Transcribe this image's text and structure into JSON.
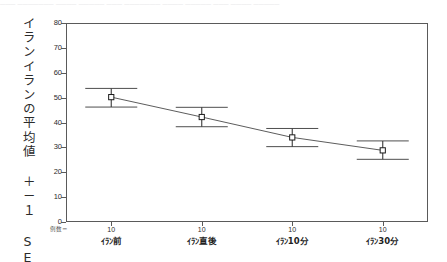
{
  "top_strip": {
    "text": "─── ─────── ──── ───── ─── ─────── ──── ───── ─── ──── ─────"
  },
  "axis": {
    "y_title": "イランイランの平均値 ＋－１ SE",
    "n_caption": "例数＝",
    "y_tick_labels": [
      "80",
      "70",
      "60",
      "50",
      "40",
      "30",
      "20",
      "10",
      "0"
    ]
  },
  "chart_data": {
    "type": "line",
    "title": "",
    "subtitle": "",
    "xlabel": "",
    "ylabel": "イランイランの平均値 ＋－１ SE",
    "categories": [
      "ｲﾗﾝ前",
      "ｲﾗﾝ直後",
      "ｲﾗﾝ10分",
      "ｲﾗﾝ30分"
    ],
    "values": [
      50.2,
      42.2,
      34.0,
      28.8
    ],
    "error_upper": [
      53.7,
      46.1,
      37.6,
      32.6
    ],
    "error_lower": [
      46.2,
      38.3,
      30.3,
      25.2
    ],
    "error_label": "±1 SE",
    "n": [
      10,
      10,
      10,
      10
    ],
    "n_labels": [
      "10",
      "10",
      "10",
      "10"
    ],
    "ylim": [
      0,
      80
    ],
    "ytick_step": 10,
    "ytick_values": [
      0,
      10,
      20,
      30,
      40,
      50,
      60,
      70,
      80
    ],
    "grid": false,
    "legend": false,
    "marker": "open-square",
    "line_color": "#4a4a4a",
    "marker_color": "#1a1a1a",
    "error_bar_color": "#3a3a3a",
    "frame_color": "#5a5a5a"
  }
}
